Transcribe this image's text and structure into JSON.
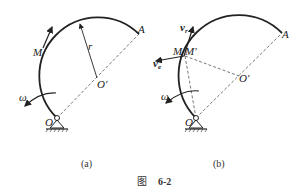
{
  "figure": {
    "caption_prefix": "图",
    "caption_number": "6-2"
  },
  "panel_a": {
    "caption": "(a)",
    "labels": {
      "M": "M",
      "r": "r",
      "A": "A",
      "O_prime": "O'",
      "O": "O",
      "omega": "ω"
    }
  },
  "panel_b": {
    "caption": "(b)",
    "labels": {
      "v_r": "v",
      "v_r_sub": "r",
      "v_e": "v",
      "v_e_sub": "e",
      "M": "M",
      "M_prime": "M'",
      "A": "A",
      "O_prime": "O'",
      "O": "O",
      "omega": "ω"
    }
  },
  "colors": {
    "stroke": "#222222",
    "dashed": "#555555"
  }
}
